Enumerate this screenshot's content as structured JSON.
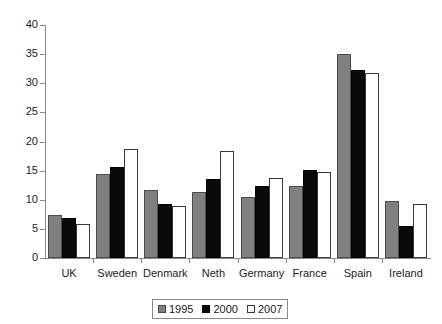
{
  "chart_data": {
    "type": "bar",
    "title": "",
    "subtitle": "",
    "xlabel": "",
    "ylabel": "",
    "ylim": [
      0,
      40
    ],
    "yticks": [
      0,
      5,
      10,
      15,
      20,
      25,
      30,
      35,
      40
    ],
    "grid": false,
    "legend_position": "bottom",
    "categories": [
      "UK",
      "Sweden",
      "Denmark",
      "Neth",
      "Germany",
      "France",
      "Spain",
      "Ireland"
    ],
    "series": [
      {
        "name": "1995",
        "color": "#808080",
        "values": [
          7.3,
          14.5,
          11.6,
          11.3,
          10.4,
          12.3,
          35.0,
          9.8
        ]
      },
      {
        "name": "2000",
        "color": "#0a0a0a",
        "values": [
          6.8,
          15.7,
          9.3,
          13.6,
          12.4,
          15.1,
          32.2,
          5.5
        ]
      },
      {
        "name": "2007",
        "color": "#ffffff",
        "values": [
          5.9,
          18.8,
          8.9,
          18.3,
          13.8,
          14.7,
          31.7,
          9.3
        ]
      }
    ]
  },
  "axis": {
    "y_tick_labels": [
      "0",
      "5",
      "10",
      "15",
      "20",
      "25",
      "30",
      "35",
      "40"
    ]
  },
  "legend": {
    "entries": [
      {
        "label": "1995"
      },
      {
        "label": "2000"
      },
      {
        "label": "2007"
      }
    ]
  }
}
